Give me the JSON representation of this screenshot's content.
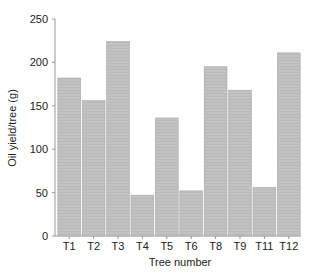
{
  "chart_data": {
    "type": "bar",
    "title": "",
    "xlabel": "Tree number",
    "ylabel": "Oil yield/tree (g)",
    "categories": [
      "T1",
      "T2",
      "T3",
      "T4",
      "T5",
      "T6",
      "T8",
      "T9",
      "T11",
      "T12"
    ],
    "values": [
      182,
      156,
      224,
      47,
      136,
      52,
      195,
      168,
      56,
      211
    ],
    "ylim": [
      0,
      250
    ],
    "yticks": [
      0,
      50,
      100,
      150,
      200,
      250
    ],
    "grid": false,
    "legend": null,
    "bar_color": "#c2c2c2"
  }
}
